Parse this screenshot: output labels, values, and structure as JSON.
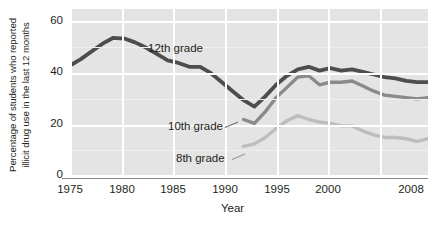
{
  "chart_data": {
    "type": "line",
    "title": "",
    "xlabel": "Year",
    "ylabel_line1": "Percentage of students who reported",
    "ylabel_line2": "illicit drug use in the last 12 months",
    "xlim": [
      1975,
      2008
    ],
    "ylim": [
      0,
      65
    ],
    "xticks": [
      "1975",
      "1980",
      "1985",
      "1990",
      "1995",
      "2000",
      "2008"
    ],
    "xtick_values": [
      1975,
      1980,
      1985,
      1990,
      1995,
      2000,
      2008
    ],
    "yticks": [
      "0",
      "20",
      "40",
      "60"
    ],
    "ytick_values": [
      0,
      20,
      40,
      60
    ],
    "grid": true,
    "grid_color": "#ffffff",
    "plot_background": "#e4e4e4",
    "legend": "inline-labels",
    "series": [
      {
        "name": "12th grade",
        "color": "#4d4d4d",
        "label_text": "12th grade",
        "x": [
          1975,
          1976,
          1977,
          1978,
          1979,
          1980,
          1981,
          1982,
          1983,
          1984,
          1985,
          1986,
          1987,
          1988,
          1989,
          1990,
          1991,
          1992,
          1993,
          1994,
          1995,
          1996,
          1997,
          1998,
          1999,
          2000,
          2001,
          2002,
          2003,
          2004,
          2005,
          2006,
          2007,
          2008
        ],
        "values": [
          43.0,
          45.5,
          48.5,
          51.5,
          53.8,
          53.5,
          52.0,
          50.0,
          47.5,
          45.0,
          44.0,
          42.5,
          42.5,
          40.0,
          36.5,
          33.0,
          29.5,
          27.0,
          31.0,
          35.5,
          39.0,
          41.5,
          42.5,
          41.0,
          42.0,
          41.0,
          41.5,
          40.5,
          39.5,
          38.5,
          38.0,
          37.0,
          36.5,
          36.5
        ],
        "label_x": 148,
        "label_y": 42
      },
      {
        "name": "10th grade",
        "color": "#8a8a8a",
        "label_text": "10th grade",
        "x": [
          1991,
          1992,
          1993,
          1994,
          1995,
          1996,
          1997,
          1998,
          1999,
          2000,
          2001,
          2002,
          2003,
          2004,
          2005,
          2006,
          2007,
          2008
        ],
        "values": [
          22.0,
          20.5,
          25.0,
          30.5,
          34.5,
          38.5,
          39.0,
          35.5,
          36.5,
          36.5,
          37.0,
          35.0,
          33.0,
          31.5,
          31.0,
          30.5,
          30.0,
          30.5
        ],
        "label_x": 168,
        "label_y": 120,
        "leader_line": true
      },
      {
        "name": "8th grade",
        "color": "#bdbdbd",
        "label_text": "8th grade",
        "x": [
          1991,
          1992,
          1993,
          1994,
          1995,
          1996,
          1997,
          1998,
          1999,
          2000,
          2001,
          2002,
          2003,
          2004,
          2005,
          2006,
          2007,
          2008
        ],
        "values": [
          11.5,
          12.5,
          15.0,
          18.5,
          21.5,
          23.5,
          22.0,
          21.0,
          20.5,
          19.5,
          19.5,
          17.5,
          16.0,
          15.0,
          15.0,
          14.5,
          13.5,
          14.5
        ],
        "label_x": 176,
        "label_y": 152,
        "leader_line": true
      }
    ]
  },
  "axes": {
    "x_title": "Year",
    "y_title_line1": "Percentage of students who reported",
    "y_title_line2": "illicit drug use in the last 12 months",
    "x_tick_labels": [
      "1975",
      "1980",
      "1985",
      "1990",
      "1995",
      "2000",
      "2008"
    ],
    "y_tick_labels": [
      "0",
      "20",
      "40",
      "60"
    ]
  },
  "series_labels": {
    "twelfth": "12th grade",
    "tenth": "10th grade",
    "eighth": "8th grade"
  },
  "colors": {
    "grade12": "#4d4d4d",
    "grade10": "#8a8a8a",
    "grade8": "#bdbdbd",
    "plot_bg": "#e4e4e4",
    "grid": "#ffffff",
    "text": "#231f20"
  }
}
